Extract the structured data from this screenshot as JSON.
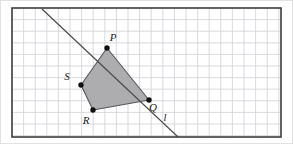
{
  "figure": {
    "type": "geometry-diagram",
    "canvas": {
      "width": 293,
      "height": 144,
      "background": "#ffffff"
    },
    "frame": {
      "x": 12,
      "y": 8,
      "width": 269,
      "height": 129,
      "stroke": "#3c3c3c",
      "stroke_width": 1.6,
      "fill": "#ffffff"
    },
    "outer_border": {
      "stroke": "#e2e2e2",
      "stroke_width": 1
    },
    "grid": {
      "cell_size": 11.6,
      "stroke": "#cfcfd6",
      "stroke_width": 0.8,
      "visible": true,
      "columns": 23,
      "rows": 11
    },
    "polygon": {
      "name": "PQRS",
      "fill": "#a9a9ac",
      "fill_opacity": 0.95,
      "stroke": "#55555a",
      "stroke_width": 1.1,
      "vertices": [
        {
          "id": "P",
          "x": 107,
          "y": 48
        },
        {
          "id": "Q",
          "x": 149,
          "y": 100
        },
        {
          "id": "R",
          "x": 93,
          "y": 110
        },
        {
          "id": "S",
          "x": 81,
          "y": 85
        }
      ]
    },
    "vertex_markers": {
      "radius": 2.7,
      "fill": "#101010"
    },
    "labels": [
      {
        "id": "P",
        "text": "P",
        "x": 113,
        "y": 41
      },
      {
        "id": "S",
        "text": "S",
        "x": 67,
        "y": 80
      },
      {
        "id": "R",
        "text": "R",
        "x": 86,
        "y": 124
      },
      {
        "id": "Q",
        "text": "Q",
        "x": 153,
        "y": 111
      },
      {
        "id": "l",
        "text": "l",
        "x": 165,
        "y": 121
      }
    ],
    "line": {
      "id": "l",
      "label": "l",
      "x1": 42,
      "y1": 9,
      "x2": 178,
      "y2": 137,
      "stroke": "#4a4a4a",
      "stroke_width": 1.2
    }
  }
}
